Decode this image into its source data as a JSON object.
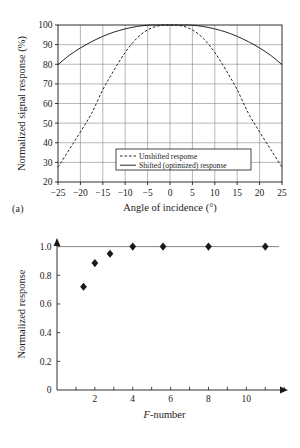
{
  "figure": {
    "panel_a_tag": "(a)",
    "panel_b_tag": "(b)"
  },
  "chart_data": [
    {
      "type": "line",
      "panel": "(a)",
      "title": "",
      "xlabel": "Angle of incidence (°)",
      "ylabel": "Normalized signal response (%)",
      "xlim": [
        -25,
        25
      ],
      "ylim": [
        20,
        100
      ],
      "xticks": [
        -25,
        -20,
        -15,
        -10,
        -5,
        0,
        5,
        10,
        15,
        20,
        25
      ],
      "xticklabels": [
        "−25",
        "−20",
        "−15",
        "−10",
        "−5",
        "0",
        "5",
        "10",
        "15",
        "20",
        "25"
      ],
      "yticks": [
        20,
        30,
        40,
        50,
        60,
        70,
        80,
        90,
        100
      ],
      "yticklabels": [
        "20",
        "30",
        "40",
        "50",
        "60",
        "70",
        "80",
        "90",
        "100"
      ],
      "grid": true,
      "legend_position": "lower center",
      "series": [
        {
          "name": "Unshifted response",
          "style": "dashed",
          "x": [
            -25,
            -22.5,
            -20,
            -17.5,
            -15,
            -12.5,
            -10,
            -7.5,
            -5,
            -2.5,
            0,
            2.5,
            5,
            7.5,
            10,
            12.5,
            15,
            17.5,
            20,
            22.5,
            25
          ],
          "y": [
            27.5,
            36.5,
            45.5,
            55.0,
            67.0,
            77.0,
            86.0,
            93.0,
            97.5,
            99.6,
            100,
            99.6,
            97.5,
            93.0,
            86.0,
            77.0,
            67.0,
            55.0,
            45.5,
            36.5,
            27.5
          ]
        },
        {
          "name": "Shifted (optimized) response",
          "style": "solid",
          "x": [
            -25,
            -22.5,
            -20,
            -17.5,
            -15,
            -12.5,
            -10,
            -7.5,
            -5,
            -2.5,
            0,
            2.5,
            5,
            7.5,
            10,
            12.5,
            15,
            17.5,
            20,
            22.5,
            25
          ],
          "y": [
            79.8,
            84.5,
            88.3,
            91.5,
            94.2,
            96.4,
            98.0,
            99.2,
            99.9,
            100,
            100,
            100,
            99.9,
            99.2,
            98.0,
            96.4,
            94.2,
            91.5,
            88.3,
            84.5,
            79.8
          ]
        }
      ]
    },
    {
      "type": "scatter",
      "panel": "(b)",
      "title": "",
      "xlabel": "F-number",
      "xlabel_italic_prefix": "F",
      "xlabel_rest": "-number",
      "ylabel": "Normalized response",
      "xlim": [
        0,
        12.2
      ],
      "ylim": [
        0,
        1.06
      ],
      "xticks": [
        1,
        2,
        3,
        4,
        5,
        6,
        7,
        8,
        9,
        10,
        11,
        12
      ],
      "xticklabels_shown": [
        "2",
        "4",
        "6",
        "8",
        "10"
      ],
      "xticklabel_values": [
        2,
        4,
        6,
        8,
        10
      ],
      "yticks": [
        0,
        0.2,
        0.4,
        0.6,
        0.8,
        1.0
      ],
      "yticklabels": [
        "0",
        "0.2",
        "0.4",
        "0.6",
        "0.8",
        "1.0"
      ],
      "grid": false,
      "marker": "diamond",
      "reference_line_y": 1.0,
      "x": [
        1.4,
        2.0,
        2.8,
        4.0,
        5.6,
        8.0,
        11.0
      ],
      "y": [
        0.72,
        0.885,
        0.95,
        1.0,
        1.0,
        1.0,
        1.0
      ]
    }
  ],
  "legend_a": {
    "items": [
      {
        "label": "Unshifted response",
        "style": "dashed"
      },
      {
        "label": "Shifted (optimized) response",
        "style": "solid"
      }
    ]
  },
  "colors": {
    "ink": "#1a1a1a",
    "grid": "#7a7a7a",
    "axis": "#1a1a1a",
    "background": "#ffffff"
  }
}
